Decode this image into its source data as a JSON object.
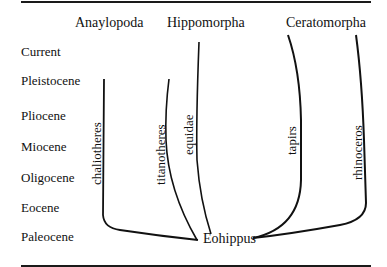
{
  "diagram": {
    "type": "phylogenetic-tree",
    "groups": [
      {
        "label": "Anaylopoda"
      },
      {
        "label": "Hippomorpha"
      },
      {
        "label": "Ceratomorpha"
      }
    ],
    "epochs": [
      {
        "label": "Current"
      },
      {
        "label": "Pleistocene"
      },
      {
        "label": "Pliocene"
      },
      {
        "label": "Miocene"
      },
      {
        "label": "Oligocene"
      },
      {
        "label": "Eocene"
      },
      {
        "label": "Paleocene"
      }
    ],
    "branches": [
      {
        "label": "chaliotheres",
        "group": "Anaylopoda"
      },
      {
        "label": "titanotheres",
        "group": "Anaylopoda"
      },
      {
        "label": "equidae",
        "group": "Hippomorpha"
      },
      {
        "label": "tapirs",
        "group": "Ceratomorpha"
      },
      {
        "label": "rhinoceros",
        "group": "Ceratomorpha"
      }
    ],
    "root": {
      "label": "Eohippus"
    }
  }
}
